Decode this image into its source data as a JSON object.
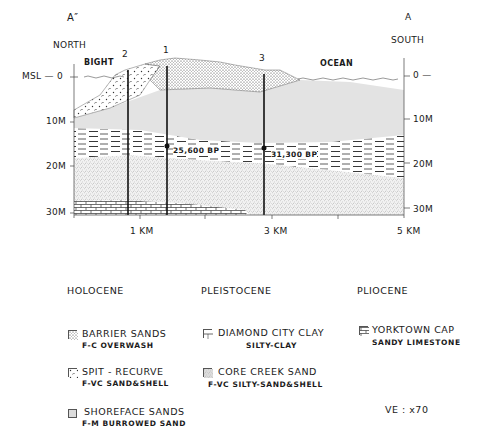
{
  "header": {
    "section_left": "A″",
    "section_right": "A",
    "dir_left": "NORTH",
    "dir_right": "SOUTH"
  },
  "labels": {
    "bight": "BIGHT",
    "ocean": "OCEAN",
    "msl": "MSL — 0",
    "right_zero": "0 —"
  },
  "cores": [
    {
      "id": "2",
      "x_px": 128
    },
    {
      "id": "1",
      "x_px": 167
    },
    {
      "id": "3",
      "x_px": 264
    }
  ],
  "dates": [
    {
      "label": "25,600 BP",
      "core": "1"
    },
    {
      "label": "31,300 BP",
      "core": "3"
    }
  ],
  "axes": {
    "depth_left": [
      "10M",
      "20M",
      "30M"
    ],
    "depth_right": [
      "10M",
      "20M",
      "30M"
    ],
    "distance": [
      "1 KM",
      "3 KM",
      "5 KM"
    ]
  },
  "legend": {
    "columns": [
      {
        "epoch": "HOLOCENE",
        "items": [
          {
            "name": "BARRIER SANDS",
            "desc": "F-C OVERWASH",
            "pattern": "dense-dots"
          },
          {
            "name": "SPIT - RECURVE",
            "desc": "F-VC SAND&SHELL",
            "pattern": "sparse-dots"
          },
          {
            "name": "SHOREFACE SANDS",
            "desc": "F-M BURROWED SAND",
            "pattern": "light-gray"
          }
        ]
      },
      {
        "epoch": "PLEISTOCENE",
        "items": [
          {
            "name": "DIAMOND CITY CLAY",
            "desc": "SILTY-CLAY",
            "pattern": "dashes"
          },
          {
            "name": "CORE CREEK SAND",
            "desc": "F-VC SILTY-SAND&SHELL",
            "pattern": "stipple"
          }
        ]
      },
      {
        "epoch": "PLIOCENE",
        "items": [
          {
            "name": "YORKTOWN CAP",
            "desc": "SANDY LIMESTONE",
            "pattern": "brick"
          }
        ]
      }
    ],
    "vertical_exaggeration": "VE : x70"
  }
}
